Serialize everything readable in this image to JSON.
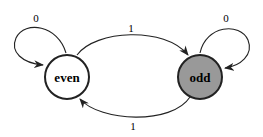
{
  "diagram": {
    "type": "state-machine",
    "states": [
      {
        "id": "even",
        "label": "even",
        "fill": "#ffffff",
        "stroke": "#222222"
      },
      {
        "id": "odd",
        "label": "odd",
        "fill": "#999999",
        "stroke": "#222222"
      }
    ],
    "transitions": [
      {
        "from": "even",
        "to": "even",
        "label": "0"
      },
      {
        "from": "even",
        "to": "odd",
        "label": "1"
      },
      {
        "from": "odd",
        "to": "odd",
        "label": "0"
      },
      {
        "from": "odd",
        "to": "even",
        "label": "1"
      }
    ]
  }
}
